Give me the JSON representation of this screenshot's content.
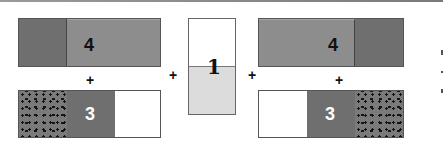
{
  "diagram": {
    "operator": "+",
    "left_group": {
      "top_bar": {
        "label": "4",
        "segments": [
          "dark",
          "mid"
        ]
      },
      "bottom_bar": {
        "label": "3",
        "segments": [
          "dotted",
          "dark",
          "white"
        ]
      }
    },
    "center_block": {
      "label": "1",
      "segments": [
        "white",
        "light"
      ]
    },
    "right_group": {
      "top_bar": {
        "label": "4",
        "segments": [
          "mid",
          "dark"
        ]
      },
      "bottom_bar": {
        "label": "3",
        "segments": [
          "white",
          "dark",
          "dotted"
        ]
      }
    },
    "colors": {
      "dark": "#6f6f6f",
      "mid": "#8d8d8d",
      "light": "#dcdcdc",
      "white": "#ffffff",
      "border": "#555555"
    }
  }
}
